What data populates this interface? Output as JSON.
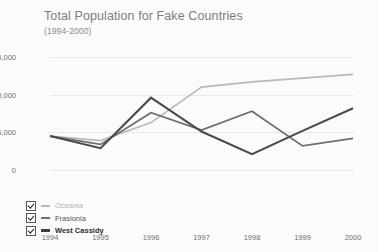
{
  "chart_data": {
    "type": "line",
    "title": "Total Population for Fake Countries",
    "subtitle": "(1994-2000)",
    "xlabel": "",
    "ylabel": "",
    "grid": true,
    "legend_position": "bottom-left",
    "categories": [
      "1994",
      "1995",
      "1996",
      "1997",
      "1998",
      "1999",
      "2000"
    ],
    "x": [
      1994,
      1995,
      1996,
      1997,
      1998,
      1999,
      2000
    ],
    "ylim": [
      0,
      15000
    ],
    "yticks": [
      "0",
      "5,000",
      "10,000",
      "15,000"
    ],
    "ytick_values": [
      0,
      5000,
      10000,
      15000
    ],
    "series": [
      {
        "name": "Oceania",
        "color": "#b9b9b9",
        "width": 1.6,
        "values": [
          4500,
          3900,
          6300,
          11000,
          11700,
          12200,
          12700
        ]
      },
      {
        "name": "Frasionia",
        "color": "#6e6e6e",
        "width": 1.8,
        "values": [
          4500,
          3400,
          7600,
          5300,
          7800,
          3200,
          4200
        ]
      },
      {
        "name": "West Cassidy",
        "color": "#4a4a4a",
        "width": 2.1,
        "values": [
          4500,
          2900,
          9600,
          5100,
          2100,
          5200,
          8200
        ]
      }
    ]
  },
  "legend": {
    "items": [
      {
        "label": "Oceania",
        "checked": true,
        "color": "#b9b9b9",
        "label_color": "#b3b3b3",
        "bold": false
      },
      {
        "label": "Frasionia",
        "checked": true,
        "color": "#6e6e6e",
        "label_color": "#555555",
        "bold": false
      },
      {
        "label": "West Cassidy",
        "checked": true,
        "color": "#3d3d3d",
        "label_color": "#2e2e2e",
        "bold": true
      }
    ]
  }
}
